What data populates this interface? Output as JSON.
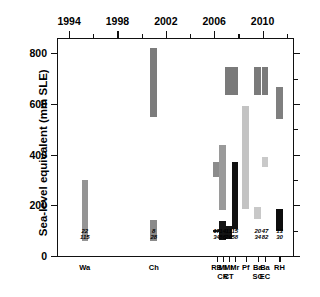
{
  "chart_data": {
    "type": "bar",
    "title": "",
    "subtitle": "",
    "xlabel": "",
    "ylabel": "Sea-level equivalent (mm SLE)",
    "ylim": [
      0,
      860
    ],
    "yticks": [
      0,
      200,
      400,
      600,
      800
    ],
    "ytick_labels": [
      "0",
      "200",
      "400",
      "600",
      "800"
    ],
    "y_minor_ticks": [
      100,
      300,
      500,
      700
    ],
    "xlim": [
      1993,
      2012.6
    ],
    "xticks_major": [
      1994,
      1998,
      2002,
      2006,
      2010
    ],
    "xtick_labels": [
      "1994",
      "1998",
      "2002",
      "2006",
      "2010"
    ],
    "xticks_minor": [
      1996,
      2000,
      2004,
      2008,
      2012
    ],
    "grid": false,
    "legend": "none",
    "orientation": "vertical-range-bars",
    "note": "Each bar spans the published low-to-high sea-level-equivalent estimate; bar x-position is the publication year.",
    "bars": [
      {
        "id": "wa",
        "label": "Wa",
        "sublabel": "",
        "year": 1995.3,
        "low": 60,
        "high": 298,
        "color": "#949494",
        "num_top": "22",
        "num_bottom": "115"
      },
      {
        "id": "ch",
        "label": "Ch",
        "sublabel": "",
        "year": 2001.0,
        "low": 60,
        "high": 143,
        "color": "#8a8a8a",
        "num_top": "8",
        "num_bottom": "28"
      },
      {
        "id": "ch_hi",
        "label": "",
        "sublabel": "",
        "year": 2001.0,
        "low": 550,
        "high": 820,
        "color": "#7c7c7c",
        "num_top": "",
        "num_bottom": ""
      },
      {
        "id": "rb",
        "label": "RB",
        "sublabel": "",
        "year": 2006.2,
        "low": 310,
        "high": 370,
        "color": "#8c8c8c",
        "num_top": "17",
        "num_bottom": "34"
      },
      {
        "id": "rb_lo",
        "label": "",
        "sublabel": "",
        "year": 2006.2,
        "low": 98,
        "high": 104,
        "color": "#1a1a1a",
        "num_top": "",
        "num_bottom": ""
      },
      {
        "id": "ml",
        "label": "Ml",
        "sublabel": "CR",
        "year": 2006.7,
        "low": 183,
        "high": 437,
        "color": "#9a9a9a",
        "num_top": "14",
        "num_bottom": "86"
      },
      {
        "id": "ml_lo",
        "label": "",
        "sublabel": "",
        "year": 2006.7,
        "low": 62,
        "high": 139,
        "color": "#141414",
        "num_top": "",
        "num_bottom": ""
      },
      {
        "id": "mr1",
        "label": "Mr",
        "sublabel": "CT",
        "year": 2007.2,
        "low": 637,
        "high": 745,
        "color": "#7a7a7a",
        "num_top": "11",
        "num_bottom": "20"
      },
      {
        "id": "mr1_lo",
        "label": "",
        "sublabel": "",
        "year": 2007.2,
        "low": 66,
        "high": 118,
        "color": "#121212",
        "num_top": "",
        "num_bottom": ""
      },
      {
        "id": "mr2",
        "label": "Mr",
        "sublabel": "",
        "year": 2007.7,
        "low": 637,
        "high": 745,
        "color": "#7a7a7a",
        "num_top": "15",
        "num_bottom": "58"
      },
      {
        "id": "mr2_lo",
        "label": "",
        "sublabel": "",
        "year": 2007.7,
        "low": 106,
        "high": 370,
        "color": "#111111",
        "num_top": "",
        "num_bottom": ""
      },
      {
        "id": "pf",
        "label": "Pf",
        "sublabel": "",
        "year": 2008.6,
        "low": 185,
        "high": 592,
        "color": "#c3c3c3",
        "num_top": "",
        "num_bottom": ""
      },
      {
        "id": "ba_sc",
        "label": "Ba",
        "sublabel": "SC",
        "year": 2009.6,
        "low": 144,
        "high": 192,
        "color": "#c8c8c8",
        "num_top": "20",
        "num_bottom": "34"
      },
      {
        "id": "ba_sc2",
        "label": "",
        "sublabel": "",
        "year": 2009.6,
        "low": 637,
        "high": 745,
        "color": "#7a7a7a",
        "num_top": "",
        "num_bottom": ""
      },
      {
        "id": "ba_ec",
        "label": "Ba",
        "sublabel": "EC",
        "year": 2010.2,
        "low": 352,
        "high": 392,
        "color": "#c9c9c9",
        "num_top": "47",
        "num_bottom": "82"
      },
      {
        "id": "ba_ec2",
        "label": "",
        "sublabel": "",
        "year": 2010.2,
        "low": 637,
        "high": 745,
        "color": "#7a7a7a",
        "num_top": "",
        "num_bottom": ""
      },
      {
        "id": "rh",
        "label": "RH",
        "sublabel": "",
        "year": 2011.4,
        "low": 540,
        "high": 668,
        "color": "#7f7f7f",
        "num_top": "13",
        "num_bottom": "30"
      },
      {
        "id": "rh_lo",
        "label": "",
        "sublabel": "",
        "year": 2011.4,
        "low": 98,
        "high": 185,
        "color": "#0d0d0d",
        "num_top": "",
        "num_bottom": ""
      }
    ],
    "category_axis": [
      {
        "label": "RB",
        "sublabel": "",
        "year": 2006.2
      },
      {
        "label": "Ml",
        "sublabel": "CR",
        "year": 2006.7
      },
      {
        "label": "Mr",
        "sublabel": "CT",
        "year": 2007.2
      },
      {
        "label": "Mr",
        "sublabel": "",
        "year": 2007.7
      },
      {
        "label": "Pf",
        "sublabel": "",
        "year": 2008.6
      },
      {
        "label": "Ba",
        "sublabel": "SC",
        "year": 2009.6
      },
      {
        "label": "Ba",
        "sublabel": "EC",
        "year": 2010.2
      },
      {
        "label": "RH",
        "sublabel": "",
        "year": 2011.4
      },
      {
        "label": "Wa",
        "sublabel": "",
        "year": 1995.3
      },
      {
        "label": "Ch",
        "sublabel": "",
        "year": 2001.0
      }
    ]
  },
  "caption": ""
}
